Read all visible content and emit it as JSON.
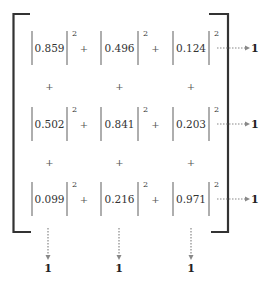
{
  "matrix": {
    "rows": [
      [
        "0.859",
        "0.496",
        "0.124"
      ],
      [
        "0.502",
        "0.841",
        "0.203"
      ],
      [
        "0.099",
        "0.216",
        "0.971"
      ]
    ],
    "exponent": "2",
    "operator": "+",
    "row_sum_labels": [
      "1",
      "1",
      "1"
    ],
    "column_sum_labels": [
      "1",
      "1",
      "1"
    ]
  },
  "colors": {
    "bracket": "#333333",
    "abs_bar": "#999999",
    "arrow": "#888888",
    "text": "#333333"
  }
}
